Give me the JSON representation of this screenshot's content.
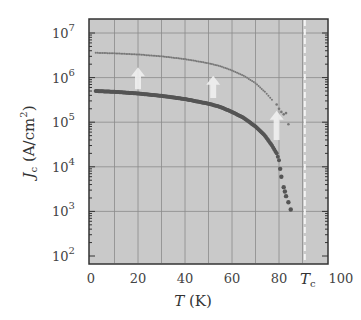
{
  "chart_data": {
    "type": "scatter",
    "title": "",
    "xlabel": "T (K)",
    "ylabel": "J_c (A/cm^2)",
    "xlim": [
      0,
      100
    ],
    "ylim": [
      100,
      10000000
    ],
    "yscale": "log",
    "grid": true,
    "x_ticks": [
      0,
      20,
      40,
      60,
      80,
      100
    ],
    "x_tick_labels": [
      "0",
      "20",
      "40",
      "60",
      "80",
      "100"
    ],
    "y_ticks": [
      100,
      1000,
      10000,
      100000,
      1000000,
      10000000
    ],
    "y_tick_labels": [
      "10^2",
      "10^3",
      "10^4",
      "10^5",
      "10^6",
      "10^7"
    ],
    "annotations": [
      {
        "type": "vline",
        "x": 91,
        "style": "dashed-white",
        "label": "T_c"
      },
      {
        "type": "arrow-up",
        "x": 20,
        "from": 550000,
        "to": 1700000
      },
      {
        "type": "arrow-up",
        "x": 52,
        "from": 350000,
        "to": 1100000
      },
      {
        "type": "arrow-up",
        "x": 79,
        "from": 40000,
        "to": 180000
      }
    ],
    "series": [
      {
        "name": "enhanced (upper)",
        "marker": "small-dot",
        "color": "#777777",
        "x": [
          2,
          10,
          20,
          30,
          40,
          50,
          55,
          60,
          65,
          70,
          74,
          77,
          79,
          80,
          81,
          82,
          83,
          84
        ],
        "y": [
          3600000,
          3500000,
          3300000,
          3000000,
          2600000,
          2100000,
          1800000,
          1450000,
          1100000,
          750000,
          480000,
          320000,
          250000,
          200000,
          170000,
          150000,
          160000,
          90000
        ]
      },
      {
        "name": "pristine (lower)",
        "marker": "dot",
        "color": "#555555",
        "x": [
          2,
          10,
          20,
          30,
          40,
          50,
          55,
          60,
          65,
          70,
          74,
          77,
          79,
          80,
          80.5,
          81,
          82,
          82.5,
          83,
          84,
          85
        ],
        "y": [
          500000,
          480000,
          440000,
          390000,
          330000,
          260000,
          220000,
          170000,
          125000,
          80000,
          50000,
          30000,
          20000,
          14000,
          9000,
          6000,
          3500,
          2800,
          2200,
          1600,
          1100
        ]
      }
    ]
  },
  "labels": {
    "x_axis_label_main": "T",
    "x_axis_label_unit": " (K)",
    "y_axis_label_main": "J",
    "y_axis_label_sub": "c",
    "y_axis_label_unit": " (A/cm",
    "y_axis_label_sup": "2",
    "y_axis_label_close": ")",
    "tc_label_main": "T",
    "tc_label_sub": "c",
    "y_tick_base": "10",
    "y_tick_exps": [
      "7",
      "6",
      "5",
      "4",
      "3",
      "2"
    ],
    "x_tick_labels": [
      "0",
      "20",
      "40",
      "60",
      "80",
      "100"
    ]
  }
}
